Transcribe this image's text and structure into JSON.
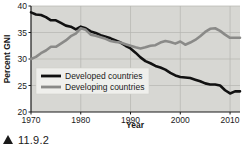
{
  "figure": {
    "caption_marker": "▲",
    "caption_number": "11.9.2"
  },
  "chart_data": {
    "type": "line",
    "title": "",
    "xlabel": "Year",
    "ylabel": "Percent GNI",
    "xlim": [
      1970,
      2012
    ],
    "ylim": [
      20,
      40
    ],
    "xticks": [
      1970,
      1980,
      1990,
      2000,
      2010
    ],
    "xtick_labels": [
      "1970",
      "1980",
      "1990",
      "2000",
      "2010"
    ],
    "yticks": [
      20,
      25,
      30,
      35,
      40
    ],
    "ytick_labels": [
      "20",
      "25",
      "30",
      "35",
      "40"
    ],
    "grid": true,
    "legend_position": "center-left",
    "plot_background": "#d7d7d3",
    "series": [
      {
        "name": "Developed countries",
        "color": "#111111",
        "x": [
          1970,
          1971,
          1972,
          1973,
          1974,
          1975,
          1976,
          1977,
          1978,
          1979,
          1980,
          1981,
          1982,
          1983,
          1984,
          1985,
          1986,
          1987,
          1988,
          1989,
          1990,
          1991,
          1992,
          1993,
          1994,
          1995,
          1996,
          1997,
          1998,
          1999,
          2000,
          2001,
          2002,
          2003,
          2004,
          2005,
          2006,
          2007,
          2008,
          2009,
          2010,
          2011,
          2012
        ],
        "values": [
          38.8,
          38.4,
          38.3,
          37.9,
          37.3,
          37.3,
          36.8,
          36.3,
          36.1,
          35.6,
          36.1,
          35.8,
          35.2,
          34.9,
          34.5,
          34.2,
          33.9,
          33.5,
          33.1,
          32.5,
          32.0,
          31.2,
          30.3,
          29.6,
          29.2,
          28.7,
          28.4,
          28.0,
          27.4,
          26.9,
          26.6,
          26.5,
          26.4,
          26.1,
          25.8,
          25.4,
          25.2,
          25.2,
          25.0,
          24.1,
          23.5,
          23.9,
          23.9
        ]
      },
      {
        "name": "Developing countries",
        "color": "#8a8a88",
        "x": [
          1970,
          1971,
          1972,
          1973,
          1974,
          1975,
          1976,
          1977,
          1978,
          1979,
          1980,
          1981,
          1982,
          1983,
          1984,
          1985,
          1986,
          1987,
          1988,
          1989,
          1990,
          1991,
          1992,
          1993,
          1994,
          1995,
          1996,
          1997,
          1998,
          1999,
          2000,
          2001,
          2002,
          2003,
          2004,
          2005,
          2006,
          2007,
          2008,
          2009,
          2010,
          2011,
          2012
        ],
        "values": [
          30.0,
          30.4,
          31.1,
          31.6,
          32.3,
          32.3,
          32.9,
          33.5,
          34.3,
          34.8,
          35.8,
          35.5,
          34.6,
          34.4,
          34.1,
          33.8,
          33.4,
          33.2,
          33.1,
          32.8,
          32.5,
          32.2,
          32.0,
          32.2,
          32.5,
          32.6,
          33.1,
          33.4,
          33.2,
          32.9,
          33.3,
          32.7,
          33.1,
          33.6,
          34.3,
          35.1,
          35.7,
          35.8,
          35.3,
          34.6,
          34.0,
          34.0,
          34.0
        ]
      }
    ]
  },
  "legend": {
    "entries": [
      {
        "label": "Developed countries",
        "color": "#111111"
      },
      {
        "label": "Developing countries",
        "color": "#8a8a88"
      }
    ]
  }
}
